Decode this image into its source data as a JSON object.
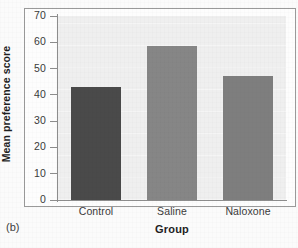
{
  "figure": {
    "panel_label": "(b)",
    "background_color": "#fbfbfb",
    "plot_background_color": "#efefef",
    "frame_color": "#9a9a9a",
    "axis_color": "#8d8d8d"
  },
  "chart_data": {
    "type": "bar",
    "title": "",
    "subtitle": "",
    "xlabel": "Group",
    "ylabel": "Mean preference score",
    "categories": [
      "Control",
      "Saline",
      "Naloxone"
    ],
    "values": [
      43,
      58.5,
      47
    ],
    "bar_colors": [
      "#4a4a4a",
      "#868686",
      "#7e7e7e"
    ],
    "ylim": [
      0,
      70
    ],
    "ytick_values": [
      70,
      60,
      50,
      40,
      30,
      20,
      10,
      0
    ],
    "ytick_labels": [
      "70",
      "60",
      "50",
      "40",
      "30",
      "20",
      "10",
      "0"
    ],
    "xtick_labels": [
      "Control",
      "Saline",
      "Naloxone"
    ],
    "grid": false,
    "legend": null,
    "legend_position": "none",
    "annotations": [
      "(b)"
    ]
  }
}
